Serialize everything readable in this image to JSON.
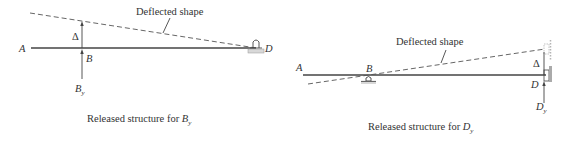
{
  "left_panel": {
    "point_A": "A",
    "point_B": "B",
    "point_D": "D",
    "delta": "Δ",
    "reaction_base": "B",
    "reaction_sub": "y",
    "deflected_label": "Deflected shape",
    "caption_prefix": "Released structure for ",
    "caption_var": "B",
    "caption_sub": "y"
  },
  "right_panel": {
    "point_A": "A",
    "point_B": "B",
    "point_D": "D",
    "delta": "Δ",
    "reaction_base": "D",
    "reaction_sub": "y",
    "deflected_label": "Deflected shape",
    "caption_prefix": "Released structure for ",
    "caption_var": "D",
    "caption_sub": "y"
  },
  "colors": {
    "line": "#444444",
    "text": "#333333",
    "support_fill": "#d8d8d8"
  }
}
